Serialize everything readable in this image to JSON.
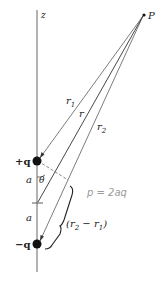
{
  "figure": {
    "axis_label": "z",
    "point_label": "P",
    "charge_positive_label": "+q",
    "charge_negative_label": "−q",
    "separation_label_upper": "a",
    "separation_label_lower": "a",
    "angle_label": "θ",
    "r1_label": "r",
    "r1_sub": "1",
    "r_label": "r",
    "r2_label": "r",
    "r2_sub": "2",
    "diff_label_open": "(r",
    "diff_label_sub2": "2",
    "diff_label_mid": " − r",
    "diff_label_sub1": "1",
    "diff_label_close": ")",
    "handwritten_note": "p = 2aq"
  },
  "colors": {
    "line": "#333333",
    "charge": "#111111",
    "handwriting": "#9a9a9a"
  }
}
